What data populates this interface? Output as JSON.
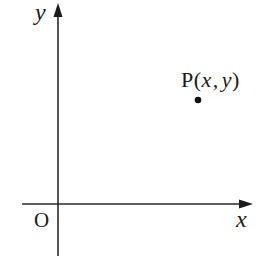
{
  "diagram": {
    "type": "coordinate-plane",
    "axes": {
      "x_axis_label": "x",
      "y_axis_label": "y",
      "origin_label": "O"
    },
    "point": {
      "name": "P",
      "label_prefix": "P",
      "label_open": "(",
      "label_x": "x",
      "label_sep": ",",
      "label_y": "y",
      "label_close": ")",
      "full_label": "P(x, y)",
      "quadrant": "I"
    },
    "colors": {
      "axis": "#2a2a2a",
      "point": "#111111",
      "text": "#1a1a1a",
      "background": "#ffffff"
    }
  }
}
